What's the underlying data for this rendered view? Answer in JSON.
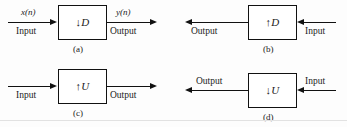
{
  "figure": {
    "panels": [
      {
        "id": "a",
        "caption": "(a)",
        "block_label": "↓D",
        "block_operator": "↓",
        "block_factor": "D",
        "direction": "left-to-right",
        "left_label": "Input",
        "left_signal": "x(n)",
        "right_label": "Output",
        "right_signal": "y(n)"
      },
      {
        "id": "b",
        "caption": "(b)",
        "block_label": "↑D",
        "block_operator": "↑",
        "block_factor": "D",
        "direction": "right-to-left",
        "left_label": "Output",
        "left_signal": "",
        "right_label": "Input",
        "right_signal": ""
      },
      {
        "id": "c",
        "caption": "(c)",
        "block_label": "↑U",
        "block_operator": "↑",
        "block_factor": "U",
        "direction": "left-to-right",
        "left_label": "Input",
        "left_signal": "",
        "right_label": "Output",
        "right_signal": ""
      },
      {
        "id": "d",
        "caption": "(d)",
        "block_label": "↓U",
        "block_operator": "↓",
        "block_factor": "U",
        "direction": "right-to-left",
        "left_label": "Output",
        "left_signal": "",
        "right_label": "Input",
        "right_signal": ""
      }
    ],
    "colors": {
      "line": "#111111",
      "background": "#fdfdfd",
      "rule": "#e2e2e2"
    }
  }
}
